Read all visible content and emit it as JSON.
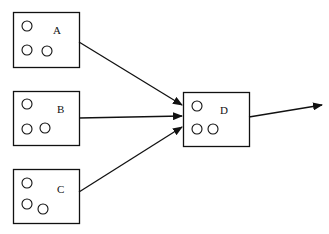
{
  "diagram": {
    "nodes": [
      {
        "id": "A",
        "label": "A"
      },
      {
        "id": "B",
        "label": "B"
      },
      {
        "id": "C",
        "label": "C"
      },
      {
        "id": "D",
        "label": "D"
      }
    ],
    "edges": [
      {
        "from": "A",
        "to": "D"
      },
      {
        "from": "B",
        "to": "D"
      },
      {
        "from": "C",
        "to": "D"
      },
      {
        "from": "D",
        "to": "output"
      }
    ],
    "colors": {
      "stroke": "#111111",
      "background": "#ffffff"
    }
  }
}
